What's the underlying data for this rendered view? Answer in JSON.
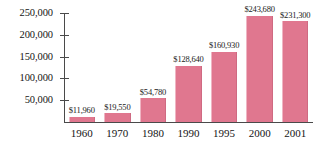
{
  "chart_data": {
    "type": "bar",
    "title": "",
    "subtitle": "",
    "xlabel": "",
    "ylabel": "",
    "categories": [
      "1960",
      "1970",
      "1980",
      "1990",
      "1995",
      "2000",
      "2001"
    ],
    "values": [
      11960,
      19550,
      54780,
      128640,
      160930,
      243680,
      231300
    ],
    "value_labels": [
      "$11,960",
      "$19,550",
      "$54,780",
      "$128,640",
      "$160,930",
      "$243,680",
      "$231,300"
    ],
    "ylim": [
      0,
      250000
    ],
    "y_ticks": [
      50000,
      100000,
      150000,
      200000,
      250000
    ],
    "y_tick_labels": [
      "50,000",
      "100,000",
      "150,000",
      "200,000",
      "250,000"
    ],
    "grid": false,
    "legend": false,
    "legend_position": "none",
    "bar_color": "#e0778f",
    "axis_color": "#4a4a4a",
    "text_color": "#141414"
  }
}
